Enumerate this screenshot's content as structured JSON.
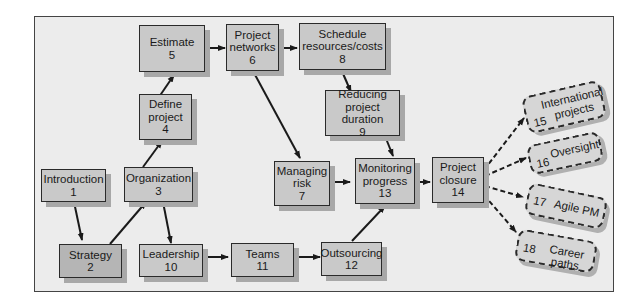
{
  "diagram": {
    "nodes": [
      {
        "id": 1,
        "label": "Introduction",
        "num": "1"
      },
      {
        "id": 2,
        "label": "Strategy",
        "num": "2"
      },
      {
        "id": 3,
        "label": "Organization",
        "num": "3"
      },
      {
        "id": 4,
        "label_lines": [
          "Define",
          "project"
        ],
        "num": "4"
      },
      {
        "id": 5,
        "label": "Estimate",
        "num": "5"
      },
      {
        "id": 6,
        "label_lines": [
          "Project",
          "networks"
        ],
        "num": "6"
      },
      {
        "id": 7,
        "label_lines": [
          "Managing",
          "risk"
        ],
        "num": "7"
      },
      {
        "id": 8,
        "label_lines": [
          "Schedule",
          "resources/costs"
        ],
        "num": "8"
      },
      {
        "id": 9,
        "label_lines": [
          "Reducing",
          "project duration"
        ],
        "num": "9"
      },
      {
        "id": 10,
        "label": "Leadership",
        "num": "10"
      },
      {
        "id": 11,
        "label": "Teams",
        "num": "11"
      },
      {
        "id": 12,
        "label": "Outsourcing",
        "num": "12"
      },
      {
        "id": 13,
        "label_lines": [
          "Monitoring",
          "progress"
        ],
        "num": "13"
      },
      {
        "id": 14,
        "label_lines": [
          "Project",
          "closure"
        ],
        "num": "14"
      }
    ],
    "optional_nodes": [
      {
        "id": 15,
        "label_lines": [
          "International",
          "projects"
        ],
        "num": "15"
      },
      {
        "id": 16,
        "label": "Oversight",
        "num": "16"
      },
      {
        "id": 17,
        "label": "Agile PM",
        "num": "17"
      },
      {
        "id": 18,
        "label": "Career paths",
        "num": "18"
      }
    ],
    "edges": [
      [
        "1",
        "2"
      ],
      [
        "2",
        "3"
      ],
      [
        "3",
        "4"
      ],
      [
        "4",
        "5"
      ],
      [
        "5",
        "6"
      ],
      [
        "6",
        "8"
      ],
      [
        "8",
        "9"
      ],
      [
        "9",
        "13"
      ],
      [
        "6",
        "7"
      ],
      [
        "7",
        "13"
      ],
      [
        "3",
        "10"
      ],
      [
        "10",
        "11"
      ],
      [
        "11",
        "12"
      ],
      [
        "12",
        "13"
      ],
      [
        "13",
        "14"
      ],
      [
        "14",
        "15"
      ],
      [
        "14",
        "16"
      ],
      [
        "14",
        "17"
      ],
      [
        "14",
        "18"
      ]
    ],
    "colors": {
      "frame_bg": "#ececec",
      "node_bg": "#c9c9c9",
      "strategy_bg": "#b5b5b5",
      "shadow": "#a8a8a8",
      "line": "#1a1a1a"
    }
  }
}
